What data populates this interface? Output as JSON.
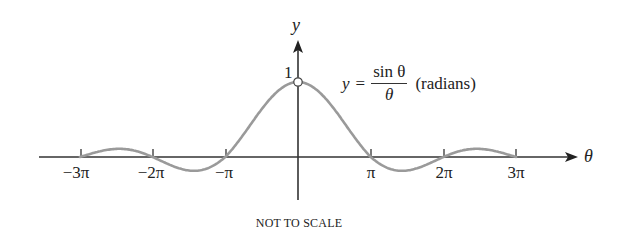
{
  "chart_data": {
    "type": "line",
    "title": "",
    "function_label": {
      "lhs": "y",
      "equals": "=",
      "numerator": "sin θ",
      "denominator": "θ",
      "unit_note": "(radians)"
    },
    "xlabel": "θ",
    "ylabel": "y",
    "x_ticks": [
      "−3π",
      "−2π",
      "−π",
      "π",
      "2π",
      "3π"
    ],
    "x_tick_values": [
      -9.4248,
      -6.2832,
      -3.1416,
      3.1416,
      6.2832,
      9.4248
    ],
    "y_ticks": [
      "1"
    ],
    "xlim": [
      -10.5,
      12.0
    ],
    "ylim": [
      -0.35,
      1.5
    ],
    "grid": false,
    "open_point": {
      "x": 0,
      "y": 1,
      "note": "hole at θ = 0 (function undefined)"
    },
    "series": [
      {
        "name": "y = sin θ / θ",
        "color": "#9a9a9a",
        "sample_x": [
          -9.4248,
          -7.725,
          -6.2832,
          -4.493,
          -3.1416,
          -1.5708,
          0,
          1.5708,
          3.1416,
          4.493,
          6.2832,
          7.725,
          9.4248
        ],
        "sample_y": [
          0,
          0.128,
          0,
          -0.217,
          0,
          0.637,
          1,
          0.637,
          0,
          -0.217,
          0,
          0.128,
          0
        ]
      }
    ],
    "scale_note": "NOT TO SCALE"
  },
  "colors": {
    "curve": "#9a9a9a",
    "axis": "#333333",
    "text": "#222222"
  }
}
